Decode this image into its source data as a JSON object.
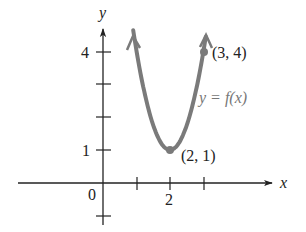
{
  "figure": {
    "axis_x_label": "x",
    "axis_y_label": "y",
    "origin_label": "0",
    "tick_label_x2": "2",
    "tick_label_y1": "1",
    "tick_label_y4": "4",
    "point_vertex_label": "(2, 1)",
    "point_top_label": "(3, 4)",
    "curve_label": "y = f(x)",
    "colors": {
      "axis": "#222222",
      "curve": "#7a7a7a",
      "curve_label": "#777777",
      "text": "#222222"
    }
  },
  "chart_data": {
    "type": "line",
    "title": "",
    "function": "y = f(x)",
    "labeled_points": [
      {
        "x": 2,
        "y": 1,
        "label": "(2, 1)"
      },
      {
        "x": 3,
        "y": 4,
        "label": "(3, 4)"
      }
    ],
    "xlabel": "x",
    "ylabel": "y",
    "x_ticks": [
      1,
      2,
      3
    ],
    "x_tick_labels": {
      "2": "2"
    },
    "y_ticks": [
      -1,
      1,
      2,
      3,
      4
    ],
    "y_tick_labels": {
      "1": "1",
      "4": "4"
    },
    "xlim": [
      -2.6,
      5.1
    ],
    "ylim": [
      -1.3,
      4.7
    ],
    "grid": false
  }
}
